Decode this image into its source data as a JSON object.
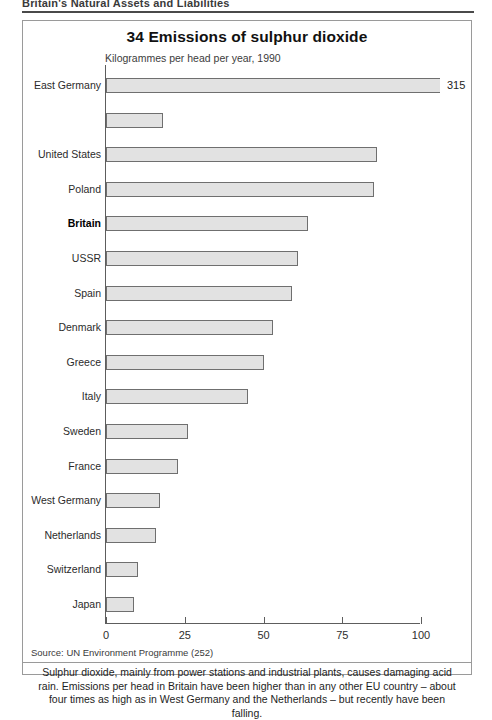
{
  "running_head": "Britain's Natural Assets and Liabilities",
  "figure": {
    "title": "34 Emissions of sulphur dioxide",
    "subtitle": "Kilogrammes per head per year, 1990",
    "source": "Source: UN Environment Programme (252)",
    "caption": "Sulphur dioxide, mainly from power stations and industrial plants, causes damaging acid rain. Emissions per head in Britain have been higher than in any other EU country – about four times as high as in West Germany and the Netherlands – but recently have been falling."
  },
  "chart_data": {
    "type": "bar",
    "orientation": "horizontal",
    "title": "34 Emissions of sulphur dioxide",
    "subtitle": "Kilogrammes per head per year, 1990",
    "xlabel": "Kilogrammes per head per year",
    "ylabel": "",
    "xlim": [
      0,
      100
    ],
    "xticks": [
      "0",
      "25",
      "50",
      "75",
      "100"
    ],
    "xtick_values": [
      0,
      25,
      50,
      75,
      100
    ],
    "grid": false,
    "legend": false,
    "note": "The top bar (East Germany, 315) is drawn broken – it extends beyond the 100 axis limit and is annotated with its value.",
    "categories": [
      "East Germany",
      "",
      "United States",
      "Poland",
      "Britain",
      "USSR",
      "Spain",
      "Denmark",
      "Greece",
      "Italy",
      "Sweden",
      "France",
      "West Germany",
      "Netherlands",
      "Switzerland",
      "Japan"
    ],
    "values": [
      315,
      18,
      86,
      85,
      64,
      61,
      59,
      53,
      50,
      45,
      26,
      23,
      17,
      16,
      10,
      9
    ],
    "bars": [
      {
        "label": "East Germany",
        "value": 315,
        "value_label": "315",
        "broken": true,
        "bold": false
      },
      {
        "label": "",
        "value": 18,
        "value_label": "",
        "broken": false,
        "bold": false
      },
      {
        "label": "United States",
        "value": 86,
        "value_label": "",
        "broken": false,
        "bold": false
      },
      {
        "label": "Poland",
        "value": 85,
        "value_label": "",
        "broken": false,
        "bold": false
      },
      {
        "label": "Britain",
        "value": 64,
        "value_label": "",
        "broken": false,
        "bold": true
      },
      {
        "label": "USSR",
        "value": 61,
        "value_label": "",
        "broken": false,
        "bold": false
      },
      {
        "label": "Spain",
        "value": 59,
        "value_label": "",
        "broken": false,
        "bold": false
      },
      {
        "label": "Denmark",
        "value": 53,
        "value_label": "",
        "broken": false,
        "bold": false
      },
      {
        "label": "Greece",
        "value": 50,
        "value_label": "",
        "broken": false,
        "bold": false
      },
      {
        "label": "Italy",
        "value": 45,
        "value_label": "",
        "broken": false,
        "bold": false
      },
      {
        "label": "Sweden",
        "value": 26,
        "value_label": "",
        "broken": false,
        "bold": false
      },
      {
        "label": "France",
        "value": 23,
        "value_label": "",
        "broken": false,
        "bold": false
      },
      {
        "label": "West Germany",
        "value": 17,
        "value_label": "",
        "broken": false,
        "bold": false
      },
      {
        "label": "Netherlands",
        "value": 16,
        "value_label": "",
        "broken": false,
        "bold": false
      },
      {
        "label": "Switzerland",
        "value": 10,
        "value_label": "",
        "broken": false,
        "bold": false
      },
      {
        "label": "Japan",
        "value": 9,
        "value_label": "",
        "broken": false,
        "bold": false
      }
    ],
    "colors": {
      "bar_fill": "#e2e2e2",
      "bar_stroke": "#6f6f6f",
      "axis": "#5d5d5d",
      "frame": "#9a9a9a",
      "text": "#1d1d1d"
    }
  }
}
